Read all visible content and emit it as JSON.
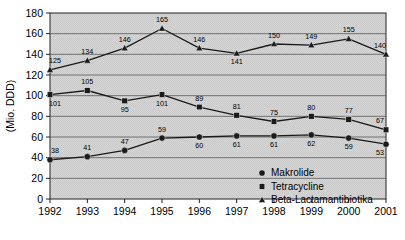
{
  "chart_data": {
    "type": "line",
    "title": "",
    "subtitle": "",
    "xlabel": "",
    "ylabel": "(Mio. DDD)",
    "x": [
      1992,
      1993,
      1994,
      1995,
      1996,
      1997,
      1998,
      1999,
      2000,
      2001
    ],
    "categories": [
      "1992",
      "1993",
      "1994",
      "1995",
      "1996",
      "1997",
      "1998",
      "1999",
      "2000",
      "2001"
    ],
    "xlim": [
      1992,
      2001
    ],
    "ylim": [
      0,
      180
    ],
    "yticks": [
      0,
      20,
      40,
      60,
      80,
      100,
      120,
      140,
      160,
      180
    ],
    "ytick_labels": [
      "0",
      "20",
      "40",
      "60",
      "80",
      "100",
      "120",
      "140",
      "160",
      "180"
    ],
    "grid": "horizontal",
    "legend_position": "inside-bottom-right",
    "plot_background": "#d4d4d4",
    "series": [
      {
        "name": "Makrolide",
        "marker": "circle",
        "color": "#1a1a1a",
        "values": [
          38,
          41,
          47,
          59,
          60,
          61,
          61,
          62,
          59,
          53
        ],
        "labels": [
          "38",
          "41",
          "47",
          "59",
          "60",
          "61",
          "61",
          "62",
          "59",
          "53"
        ],
        "label_positions": [
          "above",
          "above",
          "above",
          "above",
          "below",
          "below",
          "below",
          "below",
          "below",
          "below"
        ]
      },
      {
        "name": "Tetracycline",
        "marker": "square",
        "color": "#1a1a1a",
        "values": [
          101,
          105,
          95,
          101,
          89,
          81,
          75,
          80,
          77,
          67
        ],
        "labels": [
          "101",
          "105",
          "95",
          "101",
          "89",
          "81",
          "75",
          "80",
          "77",
          "67"
        ],
        "label_positions": [
          "below",
          "above",
          "below",
          "below",
          "above",
          "above",
          "above",
          "above",
          "above",
          "above"
        ]
      },
      {
        "name": "Beta-Lactamantibiotika",
        "marker": "triangle",
        "color": "#1a1a1a",
        "values": [
          125,
          134,
          146,
          165,
          146,
          141,
          150,
          149,
          155,
          140
        ],
        "labels": [
          "125",
          "134",
          "146",
          "165",
          "146",
          "141",
          "150",
          "149",
          "155",
          "140"
        ],
        "label_positions": [
          "above",
          "above",
          "above",
          "above",
          "above",
          "below",
          "above",
          "above",
          "above",
          "above"
        ]
      }
    ]
  }
}
